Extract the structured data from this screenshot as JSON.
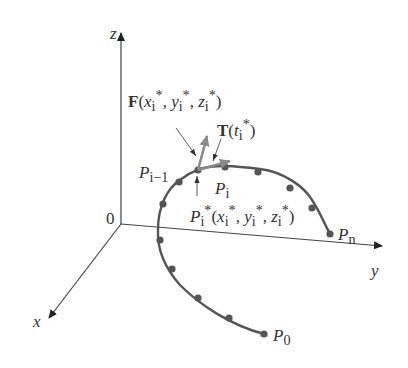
{
  "axes": {
    "x": "x",
    "y": "y",
    "z": "z",
    "origin": "0"
  },
  "labels": {
    "force": "F(x*_i, y*_i, z*_i)",
    "tangent": "T(t*_i)",
    "p_prev": "P_{i-1}",
    "p_i": "P_i",
    "p_star": "P*_i(x*_i, y*_i, z*_i)",
    "p_n": "P_n",
    "p_0": "P_0"
  },
  "colors": {
    "curve": "#555555",
    "vector": "#8a8a8a",
    "axis": "#444444",
    "point": "#555555"
  }
}
